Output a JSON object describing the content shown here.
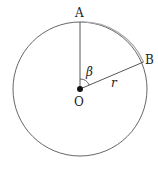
{
  "diagram": {
    "labels": {
      "point_a": "A",
      "point_b": "B",
      "center": "O",
      "angle": "β",
      "radius": "r"
    },
    "colors": {
      "circle": "#555555",
      "arc_ab": "#aaaaaa",
      "line": "#444444"
    }
  }
}
